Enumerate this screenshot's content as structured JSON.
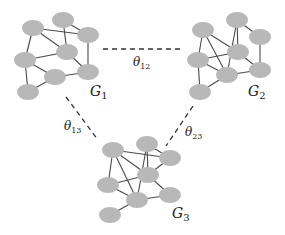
{
  "diagram": {
    "node_color": "#b8b8b8",
    "edge_color": "#4a4a4a",
    "graphs": [
      {
        "id": "G1",
        "label": "G",
        "label_sub": "1",
        "label_pos": [
          90,
          96
        ],
        "nodes": [
          [
            33,
            28
          ],
          [
            63,
            20
          ],
          [
            88,
            35
          ],
          [
            67,
            52
          ],
          [
            25,
            60
          ],
          [
            55,
            77
          ],
          [
            88,
            72
          ],
          [
            28,
            92
          ]
        ],
        "edges": [
          [
            0,
            2
          ],
          [
            0,
            3
          ],
          [
            0,
            4
          ],
          [
            1,
            3
          ],
          [
            1,
            2
          ],
          [
            2,
            6
          ],
          [
            3,
            4
          ],
          [
            3,
            6
          ],
          [
            4,
            5
          ],
          [
            4,
            7
          ],
          [
            5,
            6
          ],
          [
            5,
            7
          ]
        ]
      },
      {
        "id": "G2",
        "label": "G",
        "label_sub": "2",
        "label_pos": [
          248,
          96
        ],
        "nodes": [
          [
            203,
            30
          ],
          [
            237,
            20
          ],
          [
            260,
            37
          ],
          [
            238,
            52
          ],
          [
            198,
            60
          ],
          [
            227,
            75
          ],
          [
            260,
            70
          ],
          [
            200,
            92
          ]
        ],
        "edges": [
          [
            0,
            3
          ],
          [
            0,
            5
          ],
          [
            0,
            4
          ],
          [
            1,
            2
          ],
          [
            1,
            3
          ],
          [
            1,
            5
          ],
          [
            2,
            6
          ],
          [
            3,
            4
          ],
          [
            3,
            6
          ],
          [
            4,
            5
          ],
          [
            4,
            7
          ],
          [
            5,
            6
          ],
          [
            5,
            7
          ]
        ]
      },
      {
        "id": "G3",
        "label": "G",
        "label_sub": "3",
        "label_pos": [
          172,
          218
        ],
        "nodes": [
          [
            113,
            150
          ],
          [
            147,
            144
          ],
          [
            170,
            158
          ],
          [
            148,
            175
          ],
          [
            108,
            185
          ],
          [
            137,
            200
          ],
          [
            170,
            195
          ],
          [
            110,
            215
          ]
        ],
        "edges": [
          [
            0,
            2
          ],
          [
            0,
            3
          ],
          [
            0,
            5
          ],
          [
            1,
            2
          ],
          [
            1,
            3
          ],
          [
            1,
            5
          ],
          [
            2,
            3
          ],
          [
            3,
            4
          ],
          [
            3,
            6
          ],
          [
            4,
            5
          ],
          [
            5,
            6
          ],
          [
            5,
            7
          ],
          [
            0,
            4
          ]
        ]
      }
    ],
    "links": [
      {
        "id": "theta12",
        "label": "θ",
        "label_sub": "12",
        "from": [
          103,
          49
        ],
        "to": [
          182,
          49
        ],
        "label_pos": [
          133,
          66
        ]
      },
      {
        "id": "theta13",
        "label": "θ",
        "label_sub": "13",
        "from": [
          66,
          97
        ],
        "to": [
          98,
          140
        ],
        "label_pos": [
          64,
          130
        ]
      },
      {
        "id": "theta23",
        "label": "θ",
        "label_sub": "23",
        "from": [
          193,
          106
        ],
        "to": [
          166,
          146
        ],
        "label_pos": [
          185,
          136
        ]
      }
    ]
  }
}
